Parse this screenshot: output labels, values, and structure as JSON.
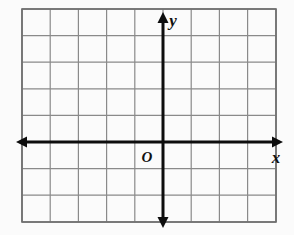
{
  "figure": {
    "kind": "coordinate-plane",
    "background_color": "#fbfbfb",
    "grid": {
      "line_color": "#8a8a8a",
      "border_color": "#6e6e6e",
      "columns": 9,
      "rows": 8,
      "cell_width": 28.2,
      "cell_height": 26.6,
      "left": 22,
      "top": 9,
      "right": 276,
      "bottom": 222
    },
    "axes": {
      "color": "#0d0d0d",
      "stroke_width": 3,
      "origin_x": 163,
      "origin_y": 142,
      "x_axis": {
        "label": "x",
        "label_x": 276,
        "label_y": 163,
        "start_x": 16,
        "end_x": 283,
        "arrow_left": true,
        "arrow_right": true
      },
      "y_axis": {
        "label": "y",
        "label_x": 173,
        "label_y": 26,
        "start_y": 12,
        "end_y": 228,
        "arrow_up": true,
        "arrow_down": true
      },
      "origin": {
        "label": "O",
        "label_x": 147,
        "label_y": 162
      }
    },
    "gridlines": {
      "vertical_x": [
        22,
        50.2,
        78.4,
        106.6,
        134.8,
        163.0,
        191.2,
        219.4,
        247.6,
        276
      ],
      "horizontal_y": [
        9,
        35.6,
        62.2,
        88.8,
        115.4,
        142.0,
        168.6,
        195.2,
        222
      ]
    }
  }
}
